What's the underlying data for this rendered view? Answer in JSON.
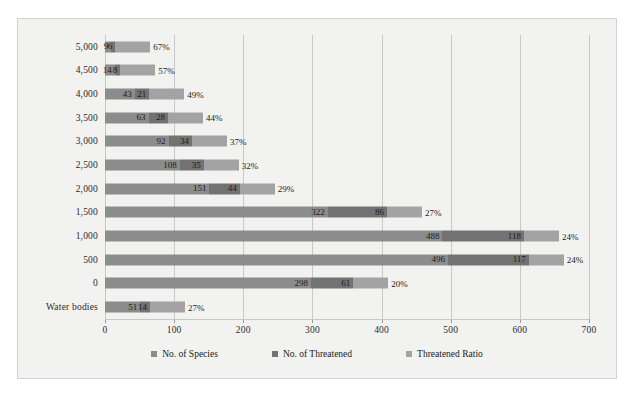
{
  "chart_data": {
    "type": "bar",
    "orientation": "horizontal",
    "stacked": true,
    "title": "",
    "xlabel": "",
    "ylabel": "",
    "xlim": [
      0,
      700
    ],
    "xticks": [
      "0",
      "100",
      "200",
      "300",
      "400",
      "500",
      "600",
      "700"
    ],
    "xtick_values": [
      0,
      100,
      200,
      300,
      400,
      500,
      600,
      700
    ],
    "grid": true,
    "legend_position": "bottom",
    "categories": [
      "5,000",
      "4,500",
      "4,000",
      "3,500",
      "3,000",
      "2,500",
      "2,000",
      "1,500",
      "1,000",
      "500",
      "0",
      "Water bodies"
    ],
    "series": [
      {
        "name": "No. of Species",
        "color": "#8c8c8c",
        "values": [
          9,
          14,
          43,
          63,
          92,
          108,
          151,
          322,
          488,
          496,
          298,
          51
        ]
      },
      {
        "name": "No. of Threatened",
        "color": "#727272",
        "values": [
          6,
          8,
          21,
          28,
          34,
          35,
          44,
          86,
          118,
          117,
          61,
          14
        ]
      },
      {
        "name": "Threatened Ratio",
        "color": "#a3a3a3",
        "values": [
          67,
          57,
          49,
          44,
          37,
          32,
          29,
          27,
          24,
          24,
          20,
          27
        ],
        "unit": "%",
        "labels": [
          "67%",
          "57%",
          "49%",
          "44%",
          "37%",
          "32%",
          "29%",
          "27%",
          "24%",
          "24%",
          "20%",
          "27%"
        ]
      }
    ]
  },
  "legend": {
    "items": [
      {
        "label": "No. of Species",
        "color": "#8c8c8c"
      },
      {
        "label": "No. of Threatened",
        "color": "#727272"
      },
      {
        "label": "Threatened  Ratio",
        "color": "#a3a3a3"
      }
    ]
  },
  "colors": {
    "background": "#f2f2f0",
    "border": "#d2d2ce",
    "gridline": "#c8c8c4",
    "text": "#1b1b1b"
  }
}
